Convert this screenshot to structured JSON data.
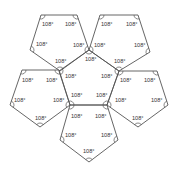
{
  "diagram": {
    "angle_label": "108°",
    "stroke_color": "#555555",
    "pentagons": [
      {
        "name": "top-left",
        "points": [
          [
            41,
            15
          ],
          [
            77,
            15
          ],
          [
            89,
            50
          ],
          [
            60,
            71
          ],
          [
            30,
            50
          ]
        ]
      },
      {
        "name": "top-right",
        "points": [
          [
            100,
            15
          ],
          [
            138,
            15
          ],
          [
            150,
            52
          ],
          [
            119,
            71
          ],
          [
            89,
            50
          ]
        ]
      },
      {
        "name": "left",
        "points": [
          [
            22,
            70
          ],
          [
            59,
            70
          ],
          [
            70,
            105
          ],
          [
            40,
            127
          ],
          [
            10,
            105
          ]
        ]
      },
      {
        "name": "center",
        "points": [
          [
            89,
            50
          ],
          [
            119,
            71
          ],
          [
            107,
            105
          ],
          [
            70,
            105
          ],
          [
            59,
            71
          ]
        ]
      },
      {
        "name": "right",
        "points": [
          [
            119,
            71
          ],
          [
            157,
            71
          ],
          [
            168,
            105
          ],
          [
            138,
            127
          ],
          [
            107,
            105
          ]
        ]
      },
      {
        "name": "bottom",
        "points": [
          [
            70,
            105
          ],
          [
            107,
            105
          ],
          [
            118,
            140
          ],
          [
            89,
            162
          ],
          [
            60,
            140
          ]
        ]
      }
    ],
    "labels": [
      {
        "x": 42,
        "y": 26,
        "text": "108°"
      },
      {
        "x": 65,
        "y": 26,
        "text": "108°"
      },
      {
        "x": 36,
        "y": 46,
        "text": "108°"
      },
      {
        "x": 73,
        "y": 47,
        "text": "108°"
      },
      {
        "x": 55,
        "y": 63,
        "text": "108°"
      },
      {
        "x": 101,
        "y": 26,
        "text": "108°"
      },
      {
        "x": 126,
        "y": 26,
        "text": "108°"
      },
      {
        "x": 94,
        "y": 47,
        "text": "108°"
      },
      {
        "x": 134,
        "y": 47,
        "text": "108°"
      },
      {
        "x": 114,
        "y": 63,
        "text": "108°"
      },
      {
        "x": 85,
        "y": 61,
        "text": "108°"
      },
      {
        "x": 22,
        "y": 82,
        "text": "108°"
      },
      {
        "x": 46,
        "y": 82,
        "text": "108°"
      },
      {
        "x": 14,
        "y": 102,
        "text": "108°"
      },
      {
        "x": 53,
        "y": 102,
        "text": "108°"
      },
      {
        "x": 35,
        "y": 120,
        "text": "108°"
      },
      {
        "x": 65,
        "y": 78,
        "text": "108°"
      },
      {
        "x": 101,
        "y": 78,
        "text": "108°"
      },
      {
        "x": 71,
        "y": 97,
        "text": "108°"
      },
      {
        "x": 96,
        "y": 97,
        "text": "108°"
      },
      {
        "x": 120,
        "y": 82,
        "text": "108°"
      },
      {
        "x": 144,
        "y": 82,
        "text": "108°"
      },
      {
        "x": 115,
        "y": 102,
        "text": "108°"
      },
      {
        "x": 151,
        "y": 102,
        "text": "108°"
      },
      {
        "x": 132,
        "y": 120,
        "text": "108°"
      },
      {
        "x": 71,
        "y": 118,
        "text": "108°"
      },
      {
        "x": 95,
        "y": 118,
        "text": "108°"
      },
      {
        "x": 65,
        "y": 137,
        "text": "108°"
      },
      {
        "x": 101,
        "y": 137,
        "text": "108°"
      },
      {
        "x": 83,
        "y": 153,
        "text": "108°"
      }
    ]
  }
}
